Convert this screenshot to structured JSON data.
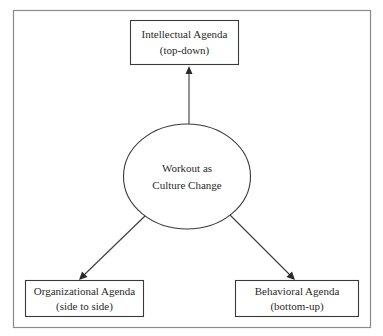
{
  "diagram": {
    "type": "hub-and-spoke",
    "center": {
      "id": "workout",
      "lines": [
        "Workout as",
        "Culture Change"
      ]
    },
    "nodes": [
      {
        "id": "intellectual",
        "lines": [
          "Intellectual Agenda",
          "(top-down)"
        ]
      },
      {
        "id": "organizational",
        "lines": [
          "Organizational Agenda",
          "(side to side)"
        ]
      },
      {
        "id": "behavioral",
        "lines": [
          "Behavioral Agenda",
          "(bottom-up)"
        ]
      }
    ],
    "edges": [
      {
        "from": "workout",
        "to": "intellectual",
        "directed": true
      },
      {
        "from": "workout",
        "to": "organizational",
        "directed": true
      },
      {
        "from": "workout",
        "to": "behavioral",
        "directed": true
      }
    ],
    "colors": {
      "line": "#3a3a3a",
      "text": "#2a2a2a",
      "frame": "#8a8a8a",
      "background": "#ffffff"
    }
  }
}
